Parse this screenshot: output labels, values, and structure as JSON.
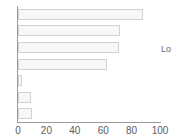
{
  "chart_data": {
    "type": "bar",
    "orientation": "horizontal",
    "title": "",
    "xlabel": "",
    "ylabel": "",
    "xlim": [
      0,
      100
    ],
    "ylim": null,
    "grid": false,
    "legend": null,
    "categories": [
      "",
      "",
      "",
      "",
      "",
      "",
      ""
    ],
    "values": [
      88,
      72,
      71,
      63,
      3,
      9,
      10
    ],
    "tick_labels": [
      "0",
      "20",
      "40",
      "60",
      "80",
      "100"
    ],
    "tick_values": [
      0,
      20,
      40,
      60,
      80,
      100
    ],
    "annotations": [
      {
        "name": "side-note",
        "text": "Lo",
        "note": "text clipped at right edge of image"
      }
    ],
    "colors": {
      "bar_fill": "#f7f7f7",
      "bar_border": "#d2d2d2",
      "axis": "#9a9a9a",
      "tick_text": "#5d5d5d",
      "background": "#ffffff"
    }
  }
}
